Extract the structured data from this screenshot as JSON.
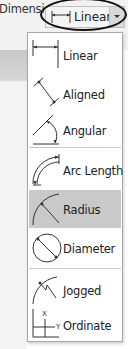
{
  "panel": {
    "title": "Dimension"
  },
  "dropdown": {
    "selected_label": "Linear",
    "icon": "linear-dimension-icon"
  },
  "menu": {
    "items": [
      {
        "label": "Linear",
        "icon": "linear-dimension-icon",
        "highlighted": false
      },
      {
        "label": "Aligned",
        "icon": "aligned-dimension-icon",
        "highlighted": false
      },
      {
        "label": "Angular",
        "icon": "angular-dimension-icon",
        "highlighted": false
      },
      {
        "label": "Arc Length",
        "icon": "arc-length-dimension-icon",
        "highlighted": false
      },
      {
        "label": "Radius",
        "icon": "radius-dimension-icon",
        "highlighted": true
      },
      {
        "label": "Diameter",
        "icon": "diameter-dimension-icon",
        "highlighted": false
      },
      {
        "label": "Jogged",
        "icon": "jogged-dimension-icon",
        "highlighted": false
      },
      {
        "label": "Ordinate",
        "icon": "ordinate-dimension-icon",
        "highlighted": false
      }
    ]
  },
  "colors": {
    "highlight": "#c9c9c9",
    "ribbon": "#f2f2f2",
    "annotation_ellipse": "#111111"
  }
}
